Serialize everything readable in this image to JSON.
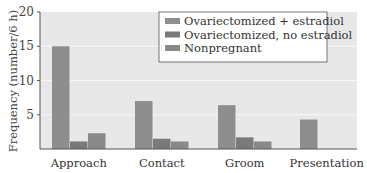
{
  "chart_data": {
    "type": "bar",
    "title": "",
    "xlabel": "",
    "ylabel": "Frequency (number/6 h)",
    "ylim": [
      0,
      20
    ],
    "yticks": [
      5,
      10,
      15,
      20
    ],
    "grid": true,
    "legend_position": "upper right",
    "categories": [
      "Approach",
      "Contact",
      "Groom",
      "Presentation"
    ],
    "series": [
      {
        "name": "Ovariectomized + estradiol",
        "color": "#8e8e8e",
        "values": [
          15,
          7,
          6.4,
          4.3
        ]
      },
      {
        "name": "Ovariectomized, no estradiol",
        "color": "#7a7a7a",
        "values": [
          1.1,
          1.5,
          1.7,
          0
        ]
      },
      {
        "name": "Nonpregnant",
        "color": "#8a8a8a",
        "values": [
          2.3,
          1.1,
          1.1,
          0
        ]
      }
    ]
  },
  "colors": {
    "plot_background": "#e8e8e8",
    "gridline": "#f7f7f7",
    "axis": "#555555"
  }
}
